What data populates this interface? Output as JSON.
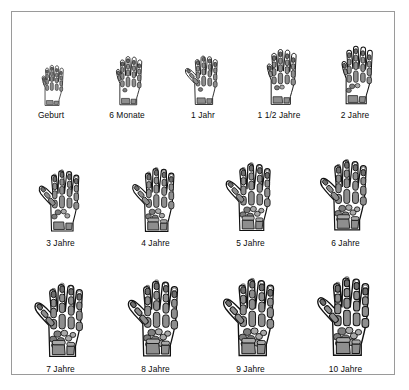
{
  "figure": {
    "title_visible": false,
    "background_color": "#ffffff",
    "border_color": "#9a9a9a",
    "bone_color": "#8e8e8e",
    "outline_color": "#111111"
  },
  "rows": [
    {
      "row_index": 1,
      "cells": [
        {
          "label": "Geburt",
          "icon": "hand-xray-icon",
          "scale": 0.6,
          "carpals": 0,
          "thumb": "tucked"
        },
        {
          "label": "6 Monate",
          "icon": "hand-xray-icon",
          "scale": 0.72,
          "carpals": 1,
          "thumb": "tucked"
        },
        {
          "label": "1 Jahr",
          "icon": "hand-xray-icon",
          "scale": 0.74,
          "carpals": 1,
          "thumb": "abducted"
        },
        {
          "label": "1 1/2 Jahre",
          "icon": "hand-xray-icon",
          "scale": 0.82,
          "carpals": 2,
          "thumb": "tucked"
        },
        {
          "label": "2 Jahre",
          "icon": "hand-xray-icon",
          "scale": 0.86,
          "carpals": 3,
          "thumb": "tucked"
        }
      ]
    },
    {
      "row_index": 2,
      "cells": [
        {
          "label": "3 Jahre",
          "icon": "hand-xray-icon",
          "scale": 0.92,
          "carpals": 4,
          "thumb": "abducted"
        },
        {
          "label": "4 Jahre",
          "icon": "hand-xray-icon",
          "scale": 0.96,
          "carpals": 5,
          "thumb": "abducted"
        },
        {
          "label": "5 Jahre",
          "icon": "hand-xray-icon",
          "scale": 1.02,
          "carpals": 6,
          "thumb": "abducted"
        },
        {
          "label": "6 Jahre",
          "icon": "hand-xray-icon",
          "scale": 1.06,
          "carpals": 7,
          "thumb": "abducted"
        }
      ]
    },
    {
      "row_index": 3,
      "cells": [
        {
          "label": "7 Jahre",
          "icon": "hand-xray-icon",
          "scale": 1.1,
          "carpals": 7,
          "thumb": "abducted"
        },
        {
          "label": "8 Jahre",
          "icon": "hand-xray-icon",
          "scale": 1.14,
          "carpals": 8,
          "thumb": "abducted"
        },
        {
          "label": "9 Jahre",
          "icon": "hand-xray-icon",
          "scale": 1.16,
          "carpals": 8,
          "thumb": "abducted"
        },
        {
          "label": "10 Jahre",
          "icon": "hand-xray-icon",
          "scale": 1.18,
          "carpals": 8,
          "thumb": "abducted"
        }
      ]
    }
  ]
}
